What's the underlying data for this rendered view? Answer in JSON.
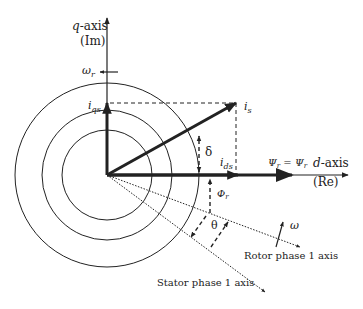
{
  "diagram": {
    "type": "phasor-diagram",
    "colors": {
      "stroke": "#222222",
      "background": "#ffffff"
    },
    "axes": {
      "q_axis": {
        "name": "q",
        "suffix": "-axis",
        "sub": "(Im)"
      },
      "d_axis": {
        "name": "d",
        "suffix": "-axis",
        "sub": "(Re)"
      }
    },
    "labels": {
      "omega_r": "ω",
      "omega_r_sub": "r",
      "i_qs": "i",
      "i_qs_sub": "qs",
      "i_s": "i",
      "i_s_sub": "s",
      "i_ds": "i",
      "i_ds_sub": "ds",
      "delta": "δ",
      "psi_r": "Ψ",
      "psi_r_sub": "r",
      "psi_eq": " = Ψ",
      "psi_eq_sub": "r",
      "phi_r": "Φ",
      "phi_r_sub": "r",
      "theta": "θ",
      "omega": "ω",
      "rotor_axis": "Rotor phase 1 axis",
      "stator_axis": "Stator phase 1 axis"
    }
  }
}
